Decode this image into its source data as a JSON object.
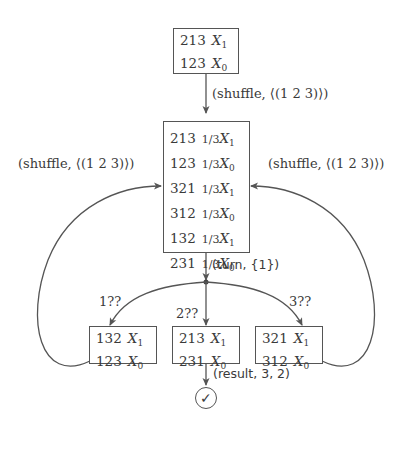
{
  "diagram": {
    "nodes": {
      "top": {
        "rows": [
          {
            "perm": "213",
            "var": "X",
            "sub": "1"
          },
          {
            "perm": "123",
            "var": "X",
            "sub": "0"
          }
        ]
      },
      "middle": {
        "rows": [
          {
            "perm": "213",
            "frac": "1/3",
            "var": "X",
            "sub": "1"
          },
          {
            "perm": "123",
            "frac": "1/3",
            "var": "X",
            "sub": "0"
          },
          {
            "perm": "321",
            "frac": "1/3",
            "var": "X",
            "sub": "1"
          },
          {
            "perm": "312",
            "frac": "1/3",
            "var": "X",
            "sub": "0"
          },
          {
            "perm": "132",
            "frac": "1/3",
            "var": "X",
            "sub": "1"
          },
          {
            "perm": "231",
            "frac": "1/3",
            "var": "X",
            "sub": "0"
          }
        ]
      },
      "left": {
        "rows": [
          {
            "perm": "132",
            "var": "X",
            "sub": "1"
          },
          {
            "perm": "123",
            "var": "X",
            "sub": "0"
          }
        ]
      },
      "center": {
        "rows": [
          {
            "perm": "213",
            "var": "X",
            "sub": "1"
          },
          {
            "perm": "231",
            "var": "X",
            "sub": "0"
          }
        ]
      },
      "right": {
        "rows": [
          {
            "perm": "321",
            "var": "X",
            "sub": "1"
          },
          {
            "perm": "312",
            "var": "X",
            "sub": "0"
          }
        ]
      },
      "accept": {
        "symbol": "✓"
      }
    },
    "edge_labels": {
      "shuffle_top": "(shuffle, ⟨(1 2 3)⟩)",
      "shuffle_left": "(shuffle, ⟨(1 2 3)⟩)",
      "shuffle_right": "(shuffle, ⟨(1 2 3)⟩)",
      "turn": "(turn, {1})",
      "branch_1": "1??",
      "branch_2": "2??",
      "branch_3": "3??",
      "result": "(result, 3, 2)"
    },
    "colors": {
      "stroke": "#555555",
      "text": "#3a3a3a"
    }
  }
}
